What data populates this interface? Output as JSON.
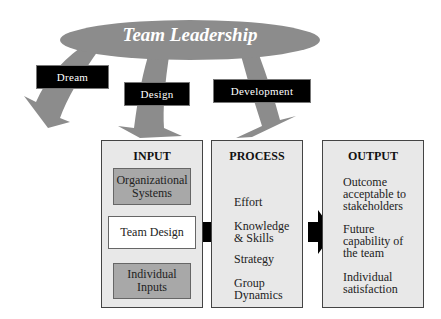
{
  "diagram": {
    "leadership": {
      "title": "Team Leadership"
    },
    "functions": [
      {
        "label": "Dream"
      },
      {
        "label": "Design"
      },
      {
        "label": "Development"
      }
    ],
    "panels": {
      "input": {
        "heading": "INPUT",
        "boxes": [
          {
            "label": "Organizational Systems"
          },
          {
            "label": "Team Design"
          },
          {
            "label": "Individual Inputs"
          }
        ]
      },
      "process": {
        "heading": "PROCESS",
        "items": [
          {
            "label": "Effort"
          },
          {
            "label": "Knowledge & Skills"
          },
          {
            "label": "Strategy"
          },
          {
            "label": "Group Dynamics"
          }
        ]
      },
      "output": {
        "heading": "OUTPUT",
        "items": [
          {
            "label": "Outcome acceptable to stakeholders"
          },
          {
            "label": "Future capability of the team"
          },
          {
            "label": "Individual satisfaction"
          }
        ]
      }
    },
    "colors": {
      "ellipse": "#8c8c8c",
      "arrows": "#8c8c8c",
      "panel_bg": "#e8e8e8",
      "box_dark": "#a8a8a8",
      "label_bg": "#000000"
    }
  }
}
